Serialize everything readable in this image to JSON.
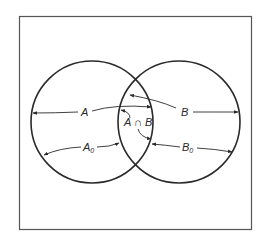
{
  "diagram": {
    "type": "venn",
    "sets": [
      {
        "name": "A",
        "label": "A",
        "sub_label": "A",
        "sub_index": "0"
      },
      {
        "name": "B",
        "label": "B",
        "sub_label": "B",
        "sub_index": "0"
      }
    ],
    "intersection": {
      "label": "A ∩ B"
    },
    "colors": {
      "stroke": "#2a2a2a",
      "frame": "#555555",
      "background": "#ffffff"
    }
  }
}
